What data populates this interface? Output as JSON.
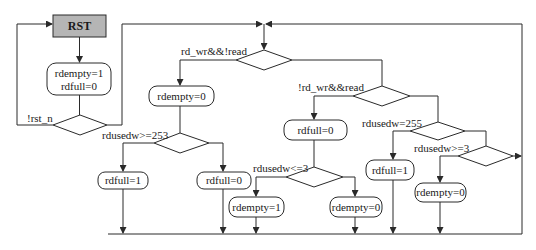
{
  "diagram": {
    "type": "flowchart",
    "start_state": {
      "label": "RST",
      "fill": "#b5b5b5"
    },
    "init_action": {
      "line1": "rdempty=1",
      "line2": "rdfull=0"
    },
    "conditions": {
      "reset": "!rst_n",
      "write_only": "rd_wr&&!read",
      "read_only": "!rd_wr&&read",
      "near_full": "rdusedw>=253",
      "full": "rdusedw=255",
      "near_empty": "rdusedw<=3",
      "not_empty": "rdusedw>=3"
    },
    "actions": {
      "wr_rdempty0": "rdempty=0",
      "wr_rdfull1": "rdfull=1",
      "wr_rdfull0": "rdfull=0",
      "rd_rdfull0": "rdfull=0",
      "rd_rdempty1": "rdempty=1",
      "rd_rdempty0": "rdempty=0",
      "full_rdfull1": "rdfull=1",
      "ne_rdempty0": "rdempty=0"
    }
  }
}
